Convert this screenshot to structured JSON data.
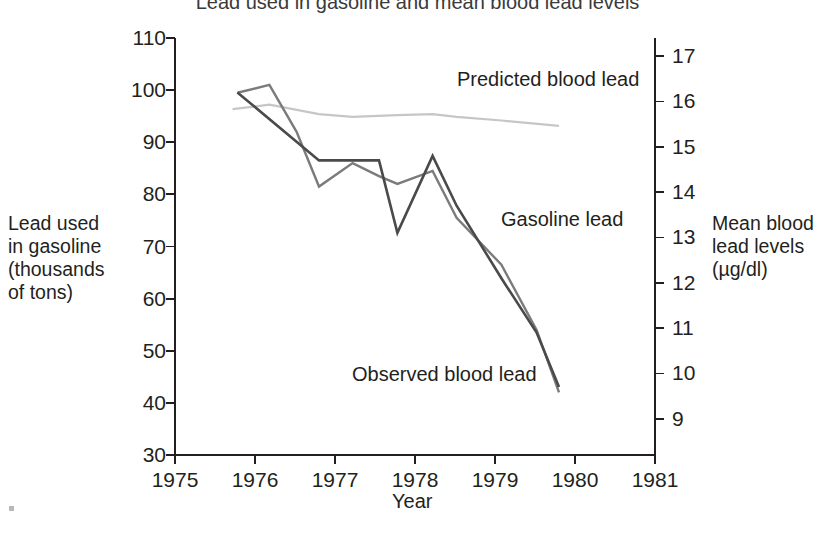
{
  "chart_data": {
    "type": "line",
    "title": "Lead used in gasoline and mean blood lead levels",
    "xlabel": "Year",
    "ylabel": "Lead used in gasoline (thousands of tons)",
    "y2label": "Mean blood lead levels (µg/dl)",
    "xlim": [
      1975,
      1981
    ],
    "ylim": [
      30,
      110
    ],
    "y2lim": [
      8.2,
      17.4
    ],
    "grid": false,
    "legend": "inline-annotations",
    "xticks": [
      "1975",
      "1976",
      "1977",
      "1978",
      "1979",
      "1980",
      "1981"
    ],
    "xtick_values": [
      1975,
      1976,
      1977,
      1978,
      1979,
      1980,
      1981
    ],
    "yticks": [
      "30",
      "40",
      "50",
      "60",
      "70",
      "80",
      "90",
      "100",
      "110"
    ],
    "ytick_values": [
      30,
      40,
      50,
      60,
      70,
      80,
      90,
      100,
      110
    ],
    "y2ticks": [
      "9",
      "10",
      "11",
      "12",
      "13",
      "14",
      "15",
      "16",
      "17"
    ],
    "y2tick_values": [
      9,
      10,
      11,
      12,
      13,
      14,
      15,
      16,
      17
    ],
    "series": [
      {
        "name": "Gasoline lead",
        "axis": "left",
        "color": "#7b7b7d",
        "width": 2.4,
        "units": "thousands of tons",
        "x": [
          1975.78,
          1976.18,
          1976.52,
          1976.8,
          1977.22,
          1977.55,
          1977.78,
          1978.22,
          1978.52,
          1979.08,
          1979.52,
          1979.8
        ],
        "values": [
          99.5,
          101.0,
          92.0,
          81.5,
          86.0,
          83.5,
          82.0,
          84.5,
          75.5,
          66.5,
          54.0,
          42.0
        ]
      },
      {
        "name": "Observed blood lead",
        "axis": "right",
        "color": "#4a4a4c",
        "width": 2.6,
        "units": "µg/dl",
        "x": [
          1975.78,
          1976.8,
          1977.22,
          1977.55,
          1977.78,
          1978.22,
          1978.52,
          1979.08,
          1979.52,
          1979.8
        ],
        "values": [
          16.2,
          14.7,
          14.7,
          14.7,
          13.1,
          14.8,
          13.7,
          12.1,
          10.9,
          9.7
        ]
      },
      {
        "name": "Predicted blood lead",
        "axis": "right",
        "color": "#c6c6c8",
        "width": 2.2,
        "units": "µg/dl",
        "x": [
          1975.72,
          1976.18,
          1976.8,
          1977.22,
          1977.78,
          1978.22,
          1978.52,
          1979.08,
          1979.8
        ],
        "values": [
          15.83,
          15.93,
          15.72,
          15.66,
          15.7,
          15.72,
          15.66,
          15.58,
          15.46
        ]
      }
    ],
    "annotations": [
      {
        "text": "Predicted blood lead",
        "x_px": 457,
        "y_px": 69
      },
      {
        "text": "Gasoline lead",
        "x_px": 501,
        "y_px": 209
      },
      {
        "text": "Observed blood lead",
        "x_px": 352,
        "y_px": 364
      }
    ]
  },
  "axes": {
    "left_title": "Lead used\nin gasoline\n(thousands\nof tons)",
    "right_title": "Mean blood\nlead levels\n(µg/dl)",
    "x_title": "Year"
  }
}
